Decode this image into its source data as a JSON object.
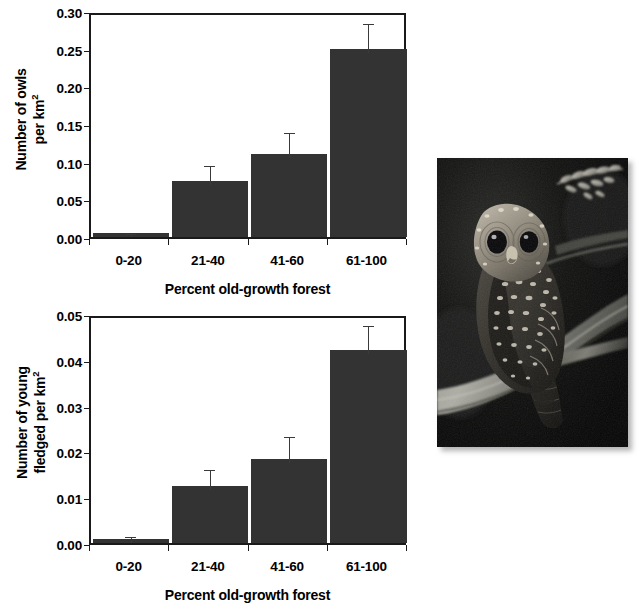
{
  "figure": {
    "background_color": "#ffffff",
    "bar_color": "#333333",
    "axis_color": "#1a1a1a"
  },
  "charts": [
    {
      "id": "owl-density-chart",
      "type": "bar",
      "title": "",
      "ylabel_line1": "Number of owls",
      "ylabel_line2": "per km",
      "ylabel_exponent": "2",
      "xlabel": "Percent old-growth forest",
      "categories": [
        "0-20",
        "21-40",
        "41-60",
        "61-100"
      ],
      "values": [
        0.005,
        0.074,
        0.11,
        0.25
      ],
      "errors": [
        0.004,
        0.026,
        0.033,
        0.038
      ],
      "ylim": [
        0.0,
        0.3
      ],
      "yticks": [
        "0.00",
        "0.05",
        "0.10",
        "0.15",
        "0.20",
        "0.25",
        "0.30"
      ],
      "ytick_values": [
        0.0,
        0.05,
        0.1,
        0.15,
        0.2,
        0.25,
        0.3
      ],
      "grid": false,
      "legend": "none"
    },
    {
      "id": "young-fledged-chart",
      "type": "bar",
      "title": "",
      "ylabel_line1": "Number of young",
      "ylabel_line2": "fledged per km",
      "ylabel_exponent": "2",
      "xlabel": "Percent old-growth forest",
      "categories": [
        "0-20",
        "21-40",
        "41-60",
        "61-100"
      ],
      "values": [
        0.0008,
        0.0125,
        0.0184,
        0.0421
      ],
      "errors": [
        0.0014,
        0.0044,
        0.0056,
        0.0062
      ],
      "ylim": [
        0.0,
        0.05
      ],
      "yticks": [
        "0.00",
        "0.01",
        "0.02",
        "0.03",
        "0.04",
        "0.05"
      ],
      "ytick_values": [
        0.0,
        0.01,
        0.02,
        0.03,
        0.04,
        0.05
      ],
      "grid": false,
      "legend": "none"
    }
  ],
  "chart_data": [
    {
      "type": "bar",
      "title": "",
      "xlabel": "Percent old-growth forest",
      "ylabel": "Number of owls per km2",
      "categories": [
        "0-20",
        "21-40",
        "41-60",
        "61-100"
      ],
      "values": [
        0.005,
        0.074,
        0.11,
        0.25
      ],
      "errors": [
        0.004,
        0.026,
        0.033,
        0.038
      ],
      "ylim": [
        0.0,
        0.3
      ],
      "tick_labels": [
        "0.00",
        "0.05",
        "0.10",
        "0.15",
        "0.20",
        "0.25",
        "0.30"
      ],
      "grid": false,
      "legend": "none"
    },
    {
      "type": "bar",
      "title": "",
      "xlabel": "Percent old-growth forest",
      "ylabel": "Number of young fledged per km2",
      "categories": [
        "0-20",
        "21-40",
        "41-60",
        "61-100"
      ],
      "values": [
        0.0008,
        0.0125,
        0.0184,
        0.0421
      ],
      "errors": [
        0.0014,
        0.0044,
        0.0056,
        0.0062
      ],
      "ylim": [
        0.0,
        0.05
      ],
      "tick_labels": [
        "0.00",
        "0.01",
        "0.02",
        "0.03",
        "0.04",
        "0.05"
      ],
      "grid": false,
      "legend": "none"
    }
  ],
  "photo": {
    "subject": "spotted-owl-perched-on-branch",
    "caption": ""
  }
}
